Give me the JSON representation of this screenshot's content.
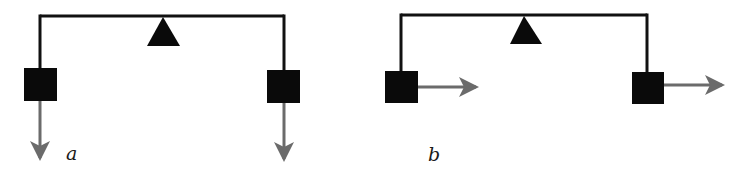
{
  "diagram": {
    "colors": {
      "beam": "#111111",
      "mass": "#0a0a0a",
      "fulcrum": "#0a0a0a",
      "force_arrow": "#6b6b6b",
      "background": "#ffffff"
    },
    "panels": [
      {
        "label": "a",
        "force_direction": "down",
        "beam": {
          "x1": 40,
          "x2": 284,
          "y": 16
        },
        "fulcrum": {
          "apex_x": 163,
          "apex_y": 17,
          "base_left": 147,
          "base_right": 180,
          "base_y": 46
        },
        "masses": [
          {
            "x": 24,
            "y": 68,
            "w": 33,
            "h": 33,
            "hang_x": 40
          },
          {
            "x": 267,
            "y": 70,
            "w": 33,
            "h": 33,
            "hang_x": 284
          }
        ],
        "arrows": [
          {
            "x1": 40,
            "y1": 101,
            "x2": 40,
            "y2": 158
          },
          {
            "x1": 284,
            "y1": 103,
            "x2": 284,
            "y2": 159
          }
        ],
        "label_pos": {
          "x": 66,
          "y": 160
        }
      },
      {
        "label": "b",
        "force_direction": "right",
        "beam": {
          "x1": 401,
          "x2": 647,
          "y": 15
        },
        "fulcrum": {
          "apex_x": 524,
          "apex_y": 16,
          "base_left": 510,
          "base_right": 542,
          "base_y": 44
        },
        "masses": [
          {
            "x": 385,
            "y": 71,
            "w": 33,
            "h": 32,
            "hang_x": 401
          },
          {
            "x": 632,
            "y": 72,
            "w": 32,
            "h": 32,
            "hang_x": 647
          }
        ],
        "arrows": [
          {
            "x1": 418,
            "y1": 87,
            "x2": 476,
            "y2": 87
          },
          {
            "x1": 664,
            "y1": 85,
            "x2": 722,
            "y2": 85
          }
        ],
        "label_pos": {
          "x": 428,
          "y": 161
        }
      }
    ]
  }
}
